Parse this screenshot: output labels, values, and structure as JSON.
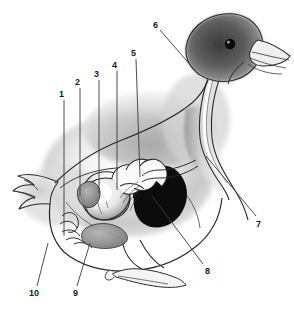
{
  "figure": {
    "style": "grayscale ink and wash illustration",
    "background_color": "#ffffff",
    "ink_color": "#1b1b1b",
    "callout_count": 10
  },
  "callouts": [
    {
      "id": "1",
      "label": "1",
      "x": 59,
      "y": 90,
      "line": {
        "x1": 64,
        "y1": 100,
        "x2": 64,
        "y2": 236
      }
    },
    {
      "id": "2",
      "label": "2",
      "x": 75,
      "y": 78,
      "line": {
        "x1": 80,
        "y1": 88,
        "x2": 80,
        "y2": 196
      }
    },
    {
      "id": "3",
      "label": "3",
      "x": 94,
      "y": 70,
      "line": {
        "x1": 99,
        "y1": 80,
        "x2": 99,
        "y2": 193
      }
    },
    {
      "id": "4",
      "label": "4",
      "x": 112,
      "y": 61,
      "line": {
        "x1": 117,
        "y1": 71,
        "x2": 117,
        "y2": 190
      }
    },
    {
      "id": "5",
      "label": "5",
      "x": 131,
      "y": 49,
      "line": {
        "x1": 136,
        "y1": 59,
        "x2": 140,
        "y2": 177
      }
    },
    {
      "id": "6",
      "label": "6",
      "x": 153,
      "y": 21,
      "line": {
        "x1": 160,
        "y1": 30,
        "x2": 199,
        "y2": 75
      }
    },
    {
      "id": "7",
      "label": "7",
      "x": 256,
      "y": 220,
      "line": {
        "x1": 256,
        "y1": 216,
        "x2": 206,
        "y2": 156
      }
    },
    {
      "id": "8",
      "label": "8",
      "x": 205,
      "y": 267,
      "line": {
        "x1": 203,
        "y1": 264,
        "x2": 152,
        "y2": 196
      }
    },
    {
      "id": "9",
      "label": "9",
      "x": 73,
      "y": 289,
      "line": {
        "x1": 77,
        "y1": 286,
        "x2": 90,
        "y2": 243
      }
    },
    {
      "id": "10",
      "label": "10",
      "x": 29,
      "y": 289,
      "line": {
        "x1": 37,
        "y1": 286,
        "x2": 48,
        "y2": 243
      }
    }
  ],
  "palette": {
    "ink": "#1b1b1b",
    "head_dark": "#4a4a4a",
    "body_mid": "#b9b9b9",
    "body_light": "#e2e2e2",
    "organ_dark": "#111111",
    "organ_light": "#f2f2f2",
    "organ_mid": "#8e8e8e",
    "white": "#ffffff"
  }
}
